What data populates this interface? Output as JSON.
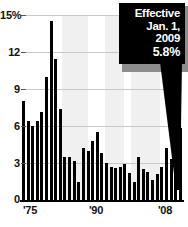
{
  "chart_data": {
    "type": "bar",
    "title": "",
    "subtitle": "",
    "xlabel": "",
    "ylabel": "",
    "ylim": [
      0,
      15
    ],
    "grid": true,
    "legend": null,
    "y_ticks": [
      "0",
      "3",
      "6",
      "9",
      "12",
      "15%"
    ],
    "y_tick_values": [
      0,
      3,
      6,
      9,
      12,
      15
    ],
    "x_ticks": [
      "'75",
      "'90",
      "'08"
    ],
    "x_tick_values": [
      1975,
      1990,
      2008
    ],
    "categories": [
      "1975",
      "1976",
      "1977",
      "1978",
      "1979",
      "1980",
      "1981",
      "1982",
      "1983",
      "1984",
      "1985",
      "1986",
      "1987",
      "1988",
      "1989",
      "1990",
      "1991",
      "1992",
      "1993",
      "1994",
      "1995",
      "1996",
      "1997",
      "1998",
      "1999",
      "2000",
      "2001",
      "2002",
      "2003",
      "2004",
      "2005",
      "2006",
      "2007",
      "2008"
    ],
    "values": [
      8.0,
      6.4,
      6.0,
      6.4,
      7.1,
      10.0,
      14.5,
      11.4,
      7.4,
      3.5,
      3.5,
      3.2,
      1.5,
      4.2,
      4.0,
      4.8,
      5.5,
      3.8,
      3.0,
      2.7,
      2.6,
      2.7,
      2.9,
      2.2,
      1.5,
      3.5,
      2.5,
      2.3,
      1.6,
      2.1,
      2.7,
      4.2,
      3.3,
      2.3
    ],
    "highlight_value": 5.8,
    "highlight_label": "2009",
    "bar_color": "#000000",
    "band_color": "#ededed",
    "shaded_bands": [
      {
        "start_pct": 25,
        "end_pct": 41
      },
      {
        "start_pct": 52,
        "end_pct": 64
      },
      {
        "start_pct": 68,
        "end_pct": 86
      }
    ],
    "annotations": [
      {
        "name": "effective-callout",
        "lines": [
          "Effective",
          "Jan. 1,",
          "2009",
          "5.8%"
        ],
        "points_to": "2009",
        "background": "#000000",
        "text_color": "#ffffff"
      }
    ]
  },
  "callout": {
    "line1": "Effective",
    "line2": "Jan. 1,",
    "line3": "2009",
    "line4": "5.8%"
  },
  "axis": {
    "y": {
      "t0": "0",
      "t1": "3",
      "t2": "6",
      "t3": "9",
      "t4": "12",
      "t5": "15%"
    },
    "x": {
      "t0": "'75",
      "t1": "'90",
      "t2": "'08"
    }
  }
}
